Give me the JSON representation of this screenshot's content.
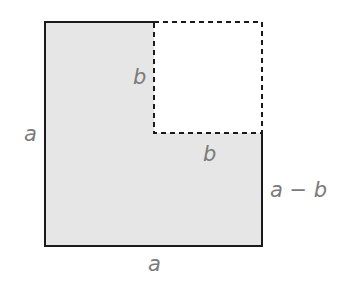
{
  "diagram": {
    "colors": {
      "fill": "#e6e6e6",
      "stroke": "#1a1a1a",
      "label": "#7a7a7a"
    },
    "labels": {
      "left_side": "a",
      "bottom_side": "a",
      "inner_vertical": "b",
      "inner_horizontal": "b",
      "right_remainder": "a − b"
    }
  }
}
